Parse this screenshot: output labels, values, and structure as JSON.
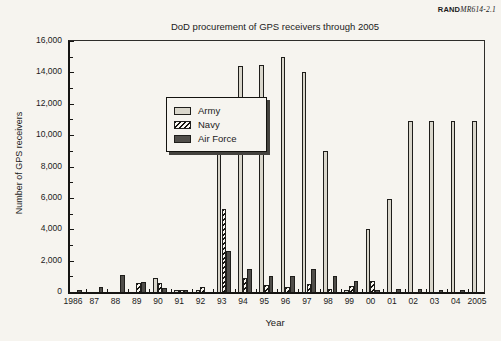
{
  "figure_label": {
    "brand": "RAND",
    "doc_id": "MR614-2.1"
  },
  "chart_data": {
    "type": "bar",
    "title": "DoD procurement of GPS receivers through 2005",
    "xlabel": "Year",
    "ylabel": "Number of GPS receivers",
    "ylim": [
      0,
      16000
    ],
    "ytick_interval": 2000,
    "ytick_labels": [
      "0",
      "2,000",
      "4,000",
      "6,000",
      "8,000",
      "10,000",
      "12,000",
      "14,000",
      "16,000"
    ],
    "grid": "off",
    "legend_position": "top-left",
    "legend_entries": [
      {
        "name": "Army",
        "style": "light-gray"
      },
      {
        "name": "Navy",
        "style": "diagonal-hatch"
      },
      {
        "name": "Air Force",
        "style": "dark-gray"
      }
    ],
    "categories": [
      "1986",
      "87",
      "88",
      "89",
      "90",
      "91",
      "92",
      "93",
      "94",
      "95",
      "96",
      "97",
      "98",
      "99",
      "00",
      "01",
      "02",
      "03",
      "04",
      "2005"
    ],
    "series": [
      {
        "name": "Army",
        "values": [
          0,
          0,
          0,
          0,
          900,
          150,
          100,
          11000,
          14400,
          14500,
          15000,
          14000,
          9000,
          150,
          4000,
          5900,
          10900,
          10900,
          10900,
          10900
        ]
      },
      {
        "name": "Navy",
        "values": [
          0,
          0,
          0,
          600,
          600,
          100,
          300,
          5300,
          900,
          450,
          300,
          500,
          200,
          400,
          700,
          0,
          0,
          0,
          0,
          0
        ]
      },
      {
        "name": "Air Force",
        "values": [
          150,
          300,
          1100,
          650,
          250,
          100,
          0,
          2600,
          1500,
          1000,
          1000,
          1500,
          1050,
          700,
          100,
          200,
          200,
          150,
          150,
          0
        ]
      }
    ],
    "colors": {
      "army": "#d9d6cb",
      "navy_hatch": "#14130f",
      "air_force": "#504e4a",
      "bar_outline": "#1f1e1b",
      "background": "#f6f4ef"
    }
  }
}
